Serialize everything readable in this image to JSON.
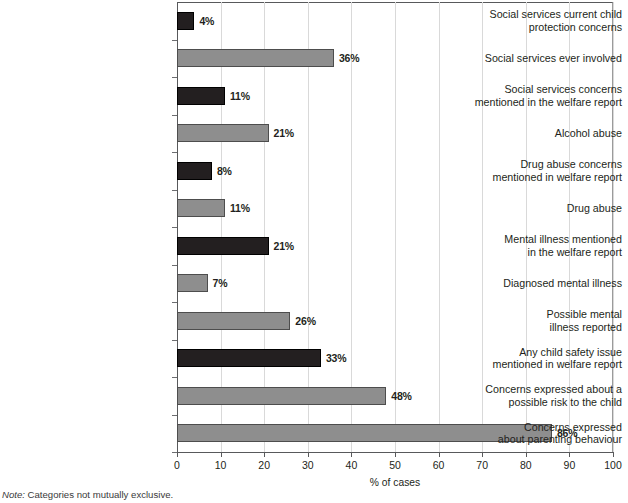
{
  "chart_data": {
    "type": "bar",
    "orientation": "horizontal",
    "title": "",
    "xlabel": "% of cases",
    "ylabel": "",
    "xlim": [
      0,
      100
    ],
    "xticks": [
      0,
      10,
      20,
      30,
      40,
      50,
      60,
      70,
      80,
      90,
      100
    ],
    "grid": "vertical",
    "legend": "none",
    "categories": [
      "Social services current child\nprotection concerns",
      "Social services ever involved",
      "Social services concerns\nmentioned in the welfare report",
      "Alcohol abuse",
      "Drug abuse concerns\nmentioned in welfare report",
      "Drug abuse",
      "Mental illness mentioned\nin the welfare report",
      "Diagnosed mental illness",
      "Possible mental\nillness reported",
      "Any child safety issue\nmentioned in welfare report",
      "Concerns expressed about a\npossible risk to the child",
      "Concerns expressed\nabout parenting behaviour"
    ],
    "values": [
      4,
      36,
      11,
      21,
      8,
      11,
      21,
      7,
      26,
      33,
      48,
      86
    ],
    "value_labels": [
      "4%",
      "36%",
      "11%",
      "21%",
      "8%",
      "11%",
      "21%",
      "7%",
      "26%",
      "33%",
      "48%",
      "86%"
    ],
    "bar_colors": [
      "dark",
      "gray",
      "dark",
      "gray",
      "dark",
      "gray",
      "dark",
      "gray",
      "gray",
      "dark",
      "gray",
      "gray"
    ],
    "annotations": {
      "note_prefix": "Note:",
      "note_text": " Categories not mutually exclusive."
    }
  },
  "colors": {
    "dark_bar": "#231f20",
    "gray_bar": "#8e8e8e",
    "gridline": "#d9d9d9",
    "axis": "#58595b",
    "text": "#231f20"
  }
}
